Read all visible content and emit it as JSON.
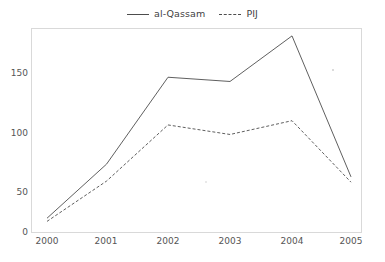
{
  "chart_data": {
    "type": "line",
    "title": "",
    "subtitle": "",
    "xlabel": "",
    "ylabel": "",
    "categories": [
      "2000",
      "2001",
      "2002",
      "2003",
      "2004",
      "2005"
    ],
    "x": [
      2000,
      2001,
      2002,
      2003,
      2004,
      2005
    ],
    "series": [
      {
        "name": "al-Qassam",
        "style": "solid",
        "color": "#4d4d4d",
        "values": [
          13,
          64,
          146,
          142,
          185,
          52
        ]
      },
      {
        "name": "PIJ",
        "style": "dashed",
        "color": "#4d4d4d",
        "values": [
          10,
          48,
          101,
          92,
          105,
          47
        ]
      }
    ],
    "ylim": [
      0,
      200
    ],
    "yticks": [
      0,
      50,
      100,
      150
    ],
    "ytick_labels": [
      "0",
      "50",
      "100",
      "150"
    ],
    "xtick_labels": [
      "2000",
      "2001",
      "2002",
      "2003",
      "2004",
      "2005"
    ],
    "grid": false,
    "legend_position": "top-center",
    "annotations": []
  },
  "legend": {
    "entries": [
      {
        "label": "al-Qassam",
        "style": "solid"
      },
      {
        "label": "PIJ",
        "style": "dashed"
      }
    ]
  },
  "axes": {
    "y_tick_labels": [
      "150",
      "100",
      "50",
      "0"
    ],
    "x_tick_labels": [
      "2000",
      "2001",
      "2002",
      "2003",
      "2004",
      "2005"
    ]
  }
}
